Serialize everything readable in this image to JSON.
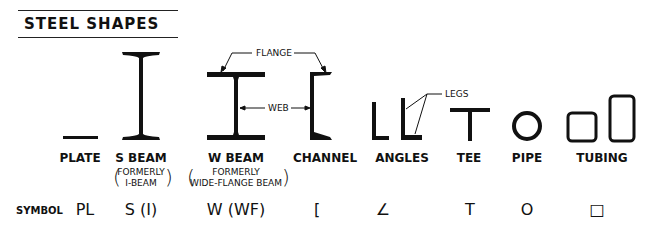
{
  "title": "STEEL SHAPES",
  "callouts": {
    "flange": "FLANGE",
    "web": "WEB",
    "legs": "LEGS"
  },
  "shapes": [
    {
      "name": "PLATE",
      "symbol": "PL"
    },
    {
      "name": "S BEAM",
      "note_line1": "FORMERLY",
      "note_line2": "I-BEAM",
      "symbol": "S (I)"
    },
    {
      "name": "W BEAM",
      "note_line1": "FORMERLY",
      "note_line2": "WIDE-FLANGE BEAM",
      "symbol": "W (WF)"
    },
    {
      "name": "CHANNEL",
      "symbol": "["
    },
    {
      "name": "ANGLES",
      "symbol": "∠"
    },
    {
      "name": "TEE",
      "symbol": "T"
    },
    {
      "name": "PIPE",
      "symbol": "O"
    },
    {
      "name": "TUBING",
      "symbol": "□"
    }
  ],
  "symbol_row_label": "SYMBOL"
}
